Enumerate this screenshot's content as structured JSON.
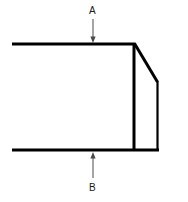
{
  "figure": {
    "type": "engineering-line-drawing",
    "background_color": "#ffffff",
    "stroke_color": "#000000",
    "width": 188,
    "height": 202
  },
  "labels": {
    "top": "A",
    "bottom": "B"
  },
  "caption": {
    "text": ""
  },
  "geometry": {
    "top_edge": {
      "x1": 12,
      "y1": 44,
      "x2": 134,
      "y2": 44
    },
    "bottom_edge": {
      "x1": 12,
      "y1": 150,
      "x2": 158,
      "y2": 150
    },
    "inner_vertical": {
      "x1": 134,
      "y1": 44,
      "x2": 134,
      "y2": 150
    },
    "chamfer": {
      "x1": 134,
      "y1": 44,
      "x2": 158,
      "y2": 82
    },
    "right_edge": {
      "x1": 158,
      "y1": 82,
      "x2": 158,
      "y2": 150
    },
    "arrow_a": {
      "x": 93,
      "y_start": 19,
      "y_end": 42,
      "direction": "down"
    },
    "arrow_b": {
      "x": 93,
      "y_start": 175,
      "y_end": 152,
      "direction": "up"
    },
    "stroke_width_main": 3,
    "stroke_width_thin": 2,
    "stroke_width_leader": 1
  }
}
